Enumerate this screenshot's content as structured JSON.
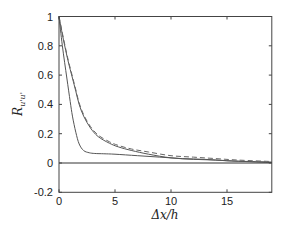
{
  "chart_data": {
    "type": "line",
    "title": "",
    "xlabel": "Δx/h",
    "ylabel": "R_{u'u'}",
    "ylabel_main": "R",
    "ylabel_sub": "u'u'",
    "xlim": [
      0,
      19
    ],
    "ylim": [
      -0.2,
      1
    ],
    "xticks": [
      0,
      5,
      10,
      15
    ],
    "xtick_labels": [
      "0",
      "5",
      "10",
      "15"
    ],
    "yticks": [
      -0.2,
      0,
      0.2,
      0.4,
      0.6,
      0.8,
      1
    ],
    "ytick_labels": [
      "-0.2",
      "0",
      "0.2",
      "0.4",
      "0.6",
      "0.8",
      "1"
    ],
    "grid": false,
    "legend": null,
    "zero_line": true,
    "series": [
      {
        "name": "inner solid",
        "style": "solid",
        "color": "#555555",
        "x": [
          0,
          0.3,
          0.7,
          1.0,
          1.2,
          1.5,
          1.8,
          2.2,
          2.7,
          3.2,
          4,
          5,
          7,
          9,
          11,
          13,
          15,
          17,
          19
        ],
        "y": [
          1.0,
          0.8,
          0.58,
          0.42,
          0.32,
          0.21,
          0.13,
          0.085,
          0.07,
          0.065,
          0.063,
          0.06,
          0.05,
          0.04,
          0.03,
          0.025,
          0.015,
          0.01,
          0.005
        ]
      },
      {
        "name": "outer solid",
        "style": "solid",
        "color": "#555555",
        "x": [
          0,
          0.4,
          0.8,
          1.2,
          1.5,
          1.8,
          2.2,
          2.8,
          3.5,
          4.5,
          5.3,
          6.5,
          8,
          10,
          12,
          14,
          16,
          19
        ],
        "y": [
          1.0,
          0.84,
          0.7,
          0.58,
          0.49,
          0.4,
          0.32,
          0.24,
          0.18,
          0.135,
          0.11,
          0.085,
          0.06,
          0.035,
          0.025,
          0.02,
          0.012,
          0.005
        ]
      },
      {
        "name": "dashed",
        "style": "dashed",
        "color": "#666666",
        "x": [
          0,
          0.4,
          0.8,
          1.2,
          1.5,
          1.8,
          2.2,
          2.8,
          3.5,
          4.5,
          5.3,
          6.5,
          8,
          10,
          12,
          14,
          16,
          19
        ],
        "y": [
          1.0,
          0.85,
          0.71,
          0.59,
          0.5,
          0.41,
          0.33,
          0.25,
          0.19,
          0.145,
          0.12,
          0.095,
          0.075,
          0.05,
          0.04,
          0.03,
          0.02,
          0.01
        ]
      }
    ]
  },
  "axis_labels": {
    "x": "Δx/h",
    "y_main": "R",
    "y_sub": "u'u'"
  }
}
